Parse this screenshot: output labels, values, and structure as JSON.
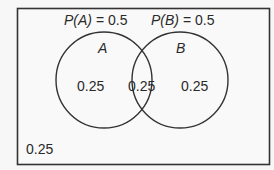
{
  "diagram": {
    "type": "venn",
    "universe_label": "0.25",
    "sets": [
      {
        "name": "A",
        "probability_label": "P(A) = 0.5",
        "p_prefix": "P(A)",
        "p_value": "= 0.5",
        "only_region": "0.25"
      },
      {
        "name": "B",
        "probability_label": "P(B) = 0.5",
        "p_prefix": "P(B)",
        "p_value": "= 0.5",
        "only_region": "0.25"
      }
    ],
    "intersection": "0.25",
    "colors": {
      "stroke": "#333333",
      "text": "#2a2a2a",
      "background": "#f7f7f7"
    }
  }
}
